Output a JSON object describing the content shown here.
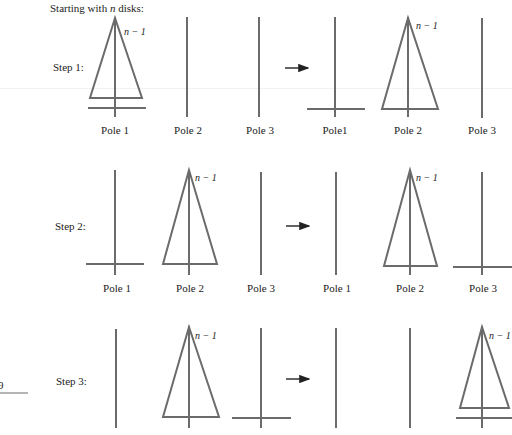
{
  "header": {
    "title_prefix": "Starting with ",
    "title_var": "n",
    "title_suffix": " disks:"
  },
  "stack_label": "n − 1",
  "fragment_left": "9",
  "steps": [
    {
      "label": "Step 1:",
      "before": {
        "pole_labels": [
          "Pole 1",
          "Pole 2",
          "Pole 3"
        ]
      },
      "after": {
        "pole_labels": [
          "Pole1",
          "Pole 2",
          "Pole 3"
        ]
      }
    },
    {
      "label": "Step 2:",
      "before": {
        "pole_labels": [
          "Pole 1",
          "Pole 2",
          "Pole 3"
        ]
      },
      "after": {
        "pole_labels": [
          "Pole 1",
          "Pole 2",
          "Pole 3"
        ]
      }
    },
    {
      "label": "Step 3:",
      "before": {
        "pole_labels": []
      },
      "after": {
        "pole_labels": []
      }
    }
  ],
  "colors": {
    "stroke": "#6b6b6b",
    "arrow": "#222222",
    "text": "#222222"
  }
}
